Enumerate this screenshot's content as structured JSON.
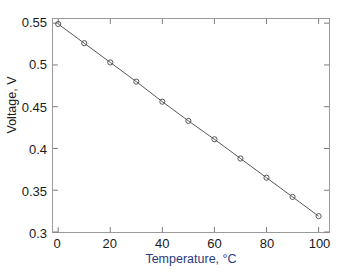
{
  "chart_data": {
    "type": "line",
    "title": "",
    "xlabel": "Temperature, °C",
    "ylabel": "Voltage, V",
    "xlim": [
      -2,
      104
    ],
    "ylim": [
      0.3,
      0.555
    ],
    "grid": false,
    "legend": null,
    "xticks": [
      0,
      20,
      40,
      60,
      80,
      100
    ],
    "xtick_labels": [
      "0",
      "20",
      "40",
      "60",
      "80",
      "100"
    ],
    "yticks": [
      0.3,
      0.35,
      0.4,
      0.45,
      0.5,
      0.55
    ],
    "ytick_labels": [
      "0.3",
      "0.35",
      "0.4",
      "0.45",
      "0.5",
      "0.55"
    ],
    "series": [
      {
        "name": "voltage-vs-temperature",
        "marker": "circle-open",
        "line_color": "#555555",
        "marker_color": "#555555",
        "x": [
          0,
          10,
          20,
          30,
          40,
          50,
          60,
          70,
          80,
          90,
          100
        ],
        "values": [
          0.549,
          0.526,
          0.503,
          0.48,
          0.456,
          0.433,
          0.411,
          0.388,
          0.365,
          0.342,
          0.319
        ]
      },
      {
        "name": "baseline-accent-line",
        "marker": "none",
        "line_color": "#8a6fa0",
        "line_color_end": "#8fc78f",
        "x": [
          0,
          100
        ],
        "values": [
          0.3,
          0.3
        ]
      }
    ]
  },
  "axes": {
    "frame_color": "#9a9a9a",
    "tick_color": "#7a7a7a",
    "xlabel_color": "#2a3a80",
    "ylabel_color": "#1a1a1a"
  }
}
